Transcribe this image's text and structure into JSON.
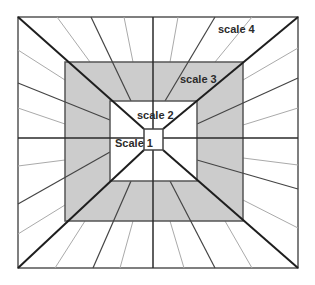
{
  "diagram": {
    "type": "nested-scales-perspective",
    "colors": {
      "background": "#ffffff",
      "scale3_fill": "#cccccc",
      "frame_stroke": "#555555",
      "main_line": "#1e1e1e",
      "dark_ray": "#444444",
      "light_ray": "#aaaaaa"
    },
    "labels": {
      "scale1": "Scale 1",
      "scale2": "scale 2",
      "scale3": "scale 3",
      "scale4": "scale 4"
    }
  }
}
